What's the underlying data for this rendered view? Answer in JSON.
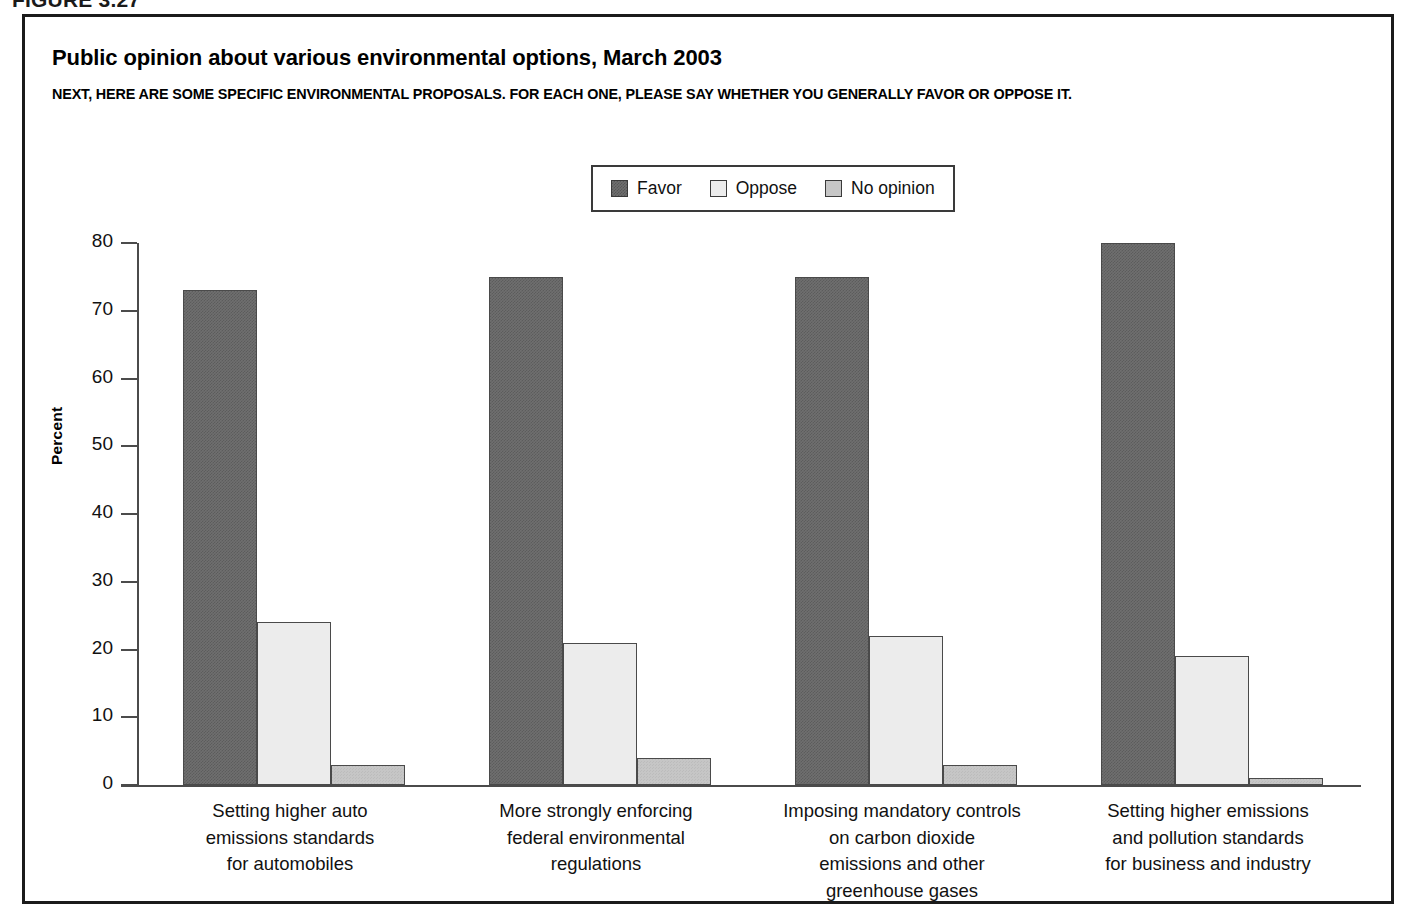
{
  "figure": {
    "number": "FIGURE 3.27"
  },
  "chart_data": {
    "type": "bar",
    "title": "Public opinion about various environmental options, March 2003",
    "subtitle": "NEXT, HERE ARE SOME SPECIFIC ENVIRONMENTAL PROPOSALS. FOR EACH ONE, PLEASE SAY WHETHER YOU GENERALLY FAVOR OR OPPOSE IT.",
    "xlabel": "",
    "ylabel": "Percent",
    "ylim": [
      0,
      80
    ],
    "yticks": [
      0,
      10,
      20,
      30,
      40,
      50,
      60,
      70,
      80
    ],
    "grid": false,
    "legend_position": "top-center",
    "categories": [
      "Setting higher auto\nemissions standards\nfor automobiles",
      "More strongly enforcing\nfederal environmental\nregulations",
      "Imposing mandatory controls\non carbon dioxide\nemissions and other\ngreenhouse gases",
      "Setting higher emissions\nand pollution standards\nfor business and industry"
    ],
    "series": [
      {
        "name": "Favor",
        "values": [
          73,
          75,
          75,
          80
        ],
        "color": "#6f6f6f"
      },
      {
        "name": "Oppose",
        "values": [
          24,
          21,
          22,
          19
        ],
        "color": "#ececec"
      },
      {
        "name": "No opinion",
        "values": [
          3,
          4,
          3,
          1
        ],
        "color": "#c6c6c6"
      }
    ]
  }
}
